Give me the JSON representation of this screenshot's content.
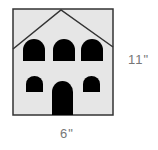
{
  "diagram": {
    "dimensions": {
      "height_label": "11\"",
      "width_label": "6\""
    },
    "colors": {
      "wall": "#e6e6e6",
      "outline": "#333333",
      "openings": "#000000",
      "label": "#777777"
    }
  }
}
